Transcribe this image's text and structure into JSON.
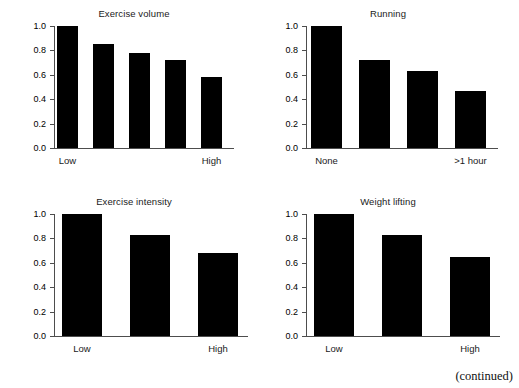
{
  "figure": {
    "width": 519,
    "height": 388,
    "background": "#ffffff",
    "bar_color": "#000000",
    "axis_color": "#4d4d4d",
    "footer_note": "(continued)"
  },
  "chart_data": [
    {
      "type": "bar",
      "title": "Exercise volume",
      "xlabel": "",
      "ylabel": "",
      "categories": [
        "Low",
        "",
        "",
        "",
        "High"
      ],
      "tick_labels_shown": [
        "Low",
        "High"
      ],
      "values": [
        1.0,
        0.85,
        0.78,
        0.72,
        0.58
      ],
      "ylim": [
        0.0,
        1.0
      ],
      "yticks": [
        "0.0",
        "0.2",
        "0.4",
        "0.6",
        "0.8",
        "1.0"
      ],
      "ytick_values": [
        0.0,
        0.2,
        0.4,
        0.6,
        0.8,
        1.0
      ],
      "grid": false,
      "legend": "none"
    },
    {
      "type": "bar",
      "title": "Running",
      "xlabel": "",
      "ylabel": "",
      "categories": [
        "None",
        "",
        "",
        ">1 hour"
      ],
      "tick_labels_shown": [
        "None",
        ">1 hour"
      ],
      "values": [
        1.0,
        0.72,
        0.63,
        0.47
      ],
      "ylim": [
        0.0,
        1.0
      ],
      "yticks": [
        "0.0",
        "0.2",
        "0.4",
        "0.6",
        "0.8",
        "1.0"
      ],
      "ytick_values": [
        0.0,
        0.2,
        0.4,
        0.6,
        0.8,
        1.0
      ],
      "grid": false,
      "legend": "none"
    },
    {
      "type": "bar",
      "title": "Exercise intensity",
      "xlabel": "",
      "ylabel": "",
      "categories": [
        "Low",
        "",
        "High"
      ],
      "tick_labels_shown": [
        "Low",
        "High"
      ],
      "values": [
        1.0,
        0.83,
        0.68
      ],
      "ylim": [
        0.0,
        1.0
      ],
      "yticks": [
        "0.0",
        "0.2",
        "0.4",
        "0.6",
        "0.8",
        "1.0"
      ],
      "ytick_values": [
        0.0,
        0.2,
        0.4,
        0.6,
        0.8,
        1.0
      ],
      "grid": false,
      "legend": "none"
    },
    {
      "type": "bar",
      "title": "Weight lifting",
      "xlabel": "",
      "ylabel": "",
      "categories": [
        "Low",
        "",
        "High"
      ],
      "tick_labels_shown": [
        "Low",
        "High"
      ],
      "values": [
        1.0,
        0.83,
        0.65
      ],
      "ylim": [
        0.0,
        1.0
      ],
      "yticks": [
        "0.0",
        "0.2",
        "0.4",
        "0.6",
        "0.8",
        "1.0"
      ],
      "ytick_values": [
        0.0,
        0.2,
        0.4,
        0.6,
        0.8,
        1.0
      ],
      "grid": false,
      "legend": "none"
    }
  ],
  "panels": [
    {
      "name": "exercise-volume",
      "left": 14,
      "top": 8,
      "width": 240,
      "plot_left": 40,
      "plot_width": 190,
      "plot_height": 122,
      "bar_width": 21,
      "bar_pitch": 36,
      "bar_offset": 3,
      "axis_extra": 12
    },
    {
      "name": "running",
      "left": 266,
      "top": 8,
      "width": 244,
      "plot_left": 40,
      "plot_width": 190,
      "plot_height": 122,
      "bar_width": 31,
      "bar_pitch": 48,
      "bar_offset": 5,
      "axis_extra": 12
    },
    {
      "name": "exercise-intensity",
      "left": 14,
      "top": 196,
      "width": 240,
      "plot_left": 40,
      "plot_width": 190,
      "plot_height": 122,
      "bar_width": 40,
      "bar_pitch": 68,
      "bar_offset": 8,
      "axis_extra": 10
    },
    {
      "name": "weight-lifting",
      "left": 266,
      "top": 196,
      "width": 244,
      "plot_left": 40,
      "plot_width": 190,
      "plot_height": 122,
      "bar_width": 40,
      "bar_pitch": 68,
      "bar_offset": 8,
      "axis_extra": 10
    }
  ]
}
